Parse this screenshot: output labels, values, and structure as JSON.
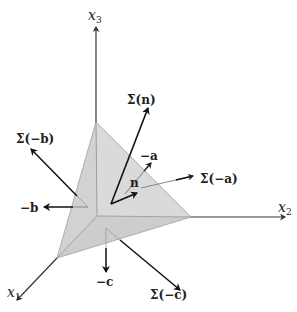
{
  "figure": {
    "type": "3D tetrahedron stress diagram",
    "colors": {
      "face_fill": "#cfcfcf",
      "face_fill_light": "#d9d9d9",
      "edge": "#9a9a9a",
      "axis": "#333333",
      "arrow": "#111111",
      "faint_arrow": "#6e6e6e"
    },
    "axes": {
      "x1": {
        "base": "x",
        "sub": "1"
      },
      "x2": {
        "base": "x",
        "sub": "2"
      },
      "x3": {
        "base": "x",
        "sub": "3"
      }
    },
    "vectors": {
      "sigma_n": "Σ(n)",
      "n": "n",
      "neg_a": "−a",
      "sigma_neg_a": "Σ(−a)",
      "sigma_neg_b": "Σ(−b)",
      "neg_b": "−b",
      "neg_c": "−c",
      "sigma_neg_c": "Σ(−c)"
    }
  }
}
